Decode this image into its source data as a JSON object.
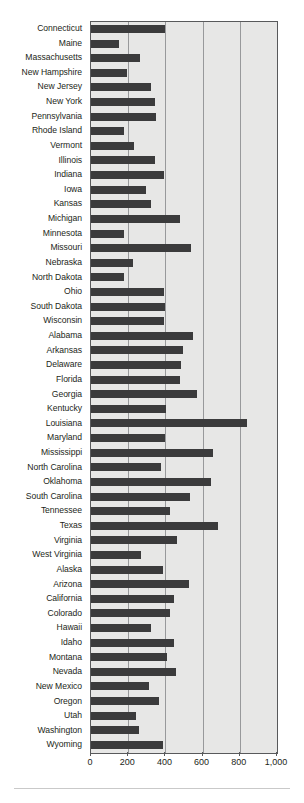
{
  "chart_data": {
    "type": "bar",
    "orientation": "horizontal",
    "title": "",
    "subtitle": "",
    "xlabel": "",
    "ylabel": "",
    "xlim": [
      0,
      1000
    ],
    "xticks": [
      0,
      200,
      400,
      600,
      800,
      1000
    ],
    "xtick_labels": [
      "0",
      "200",
      "400",
      "600",
      "800",
      "1,000"
    ],
    "grid": true,
    "gridlines_axis": "x",
    "legend": false,
    "legend_position": "none",
    "bar_color": "#3b3b3c",
    "plot_background": "#e7e7e6",
    "axis_color": "#58595b",
    "gridline_color": "#98999b",
    "label_color": "#231f20",
    "categories": [
      "Connecticut",
      "Maine",
      "Massachusetts",
      "New Hampshire",
      "New Jersey",
      "New York",
      "Pennsylvania",
      "Rhode Island",
      "Vermont",
      "Illinois",
      "Indiana",
      "Iowa",
      "Kansas",
      "Michigan",
      "Minnesota",
      "Missouri",
      "Nebraska",
      "North Dakota",
      "Ohio",
      "South Dakota",
      "Wisconsin",
      "Alabama",
      "Arkansas",
      "Delaware",
      "Florida",
      "Georgia",
      "Kentucky",
      "Louisiana",
      "Maryland",
      "Mississippi",
      "North Carolina",
      "Oklahoma",
      "South Carolina",
      "Tennessee",
      "Texas",
      "Virginia",
      "West Virginia",
      "Alaska",
      "Arizona",
      "California",
      "Colorado",
      "Hawaii",
      "Idaho",
      "Montana",
      "Nevada",
      "New Mexico",
      "Oregon",
      "Utah",
      "Washington",
      "Wyoming"
    ],
    "values": [
      400,
      150,
      265,
      195,
      325,
      345,
      350,
      180,
      230,
      345,
      390,
      295,
      325,
      480,
      175,
      535,
      225,
      180,
      395,
      400,
      390,
      550,
      495,
      485,
      480,
      570,
      405,
      840,
      400,
      655,
      375,
      645,
      530,
      425,
      685,
      465,
      270,
      385,
      525,
      445,
      425,
      320,
      445,
      410,
      455,
      310,
      365,
      240,
      260,
      385
    ]
  }
}
